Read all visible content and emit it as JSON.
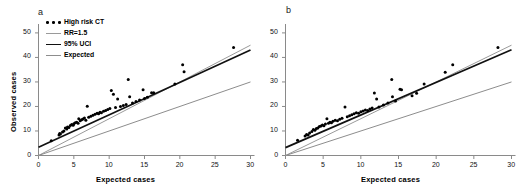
{
  "figure": {
    "panels": [
      {
        "letter": "a",
        "has_ylabel": true
      },
      {
        "letter": "b",
        "has_ylabel": false
      }
    ],
    "axis": {
      "xlabel": "Expected cases",
      "ylabel": "Observed cases",
      "xticks": [
        "0",
        "5",
        "10",
        "15",
        "20",
        "25",
        "30"
      ],
      "yticks": [
        "0",
        "10",
        "20",
        "30",
        "40",
        "50"
      ]
    },
    "legend": {
      "items": [
        {
          "label": "High risk CT",
          "key": "dots",
          "color": "#000000"
        },
        {
          "label": "RR=1.5",
          "key": "line",
          "color": "#9a9a9a"
        },
        {
          "label": "95% UCI",
          "key": "line",
          "color": "#111111"
        },
        {
          "label": "Expected",
          "key": "line",
          "color": "#8d8d8d"
        }
      ]
    }
  },
  "chart_data": {
    "type": "scatter",
    "title": "",
    "xlabel": "Expected cases",
    "ylabel": "Observed cases",
    "xlim": [
      0,
      30
    ],
    "ylim": [
      0,
      52
    ],
    "grid": false,
    "legend_position": "top-left",
    "panels": [
      {
        "id": "a",
        "letter": "a",
        "series": [
          {
            "name": "High risk CT",
            "type": "scatter",
            "color": "#000000",
            "points": [
              [
                1.8,
                6.0
              ],
              [
                2.9,
                8.4
              ],
              [
                3.0,
                9.0
              ],
              [
                3.1,
                8.8
              ],
              [
                3.4,
                9.6
              ],
              [
                3.6,
                10.0
              ],
              [
                3.8,
                11.2
              ],
              [
                4.0,
                10.8
              ],
              [
                4.1,
                11.6
              ],
              [
                4.3,
                11.4
              ],
              [
                4.5,
                12.2
              ],
              [
                4.7,
                12.6
              ],
              [
                4.9,
                12.3
              ],
              [
                5.0,
                13.0
              ],
              [
                5.2,
                13.4
              ],
              [
                5.4,
                13.6
              ],
              [
                5.6,
                13.2
              ],
              [
                5.7,
                15.0
              ],
              [
                5.9,
                14.2
              ],
              [
                6.1,
                14.6
              ],
              [
                6.3,
                14.9
              ],
              [
                6.5,
                15.3
              ],
              [
                6.7,
                14.4
              ],
              [
                6.9,
                20.1
              ],
              [
                7.1,
                15.6
              ],
              [
                7.4,
                16.0
              ],
              [
                7.7,
                16.4
              ],
              [
                8.0,
                16.8
              ],
              [
                8.3,
                17.2
              ],
              [
                8.5,
                17.0
              ],
              [
                8.7,
                17.6
              ],
              [
                8.9,
                17.4
              ],
              [
                9.2,
                18.0
              ],
              [
                9.5,
                18.4
              ],
              [
                9.8,
                18.8
              ],
              [
                10.1,
                19.2
              ],
              [
                10.3,
                26.5
              ],
              [
                10.6,
                25.0
              ],
              [
                10.9,
                19.6
              ],
              [
                11.2,
                23.0
              ],
              [
                11.6,
                20.0
              ],
              [
                12.0,
                20.4
              ],
              [
                12.4,
                20.8
              ],
              [
                12.7,
                31.0
              ],
              [
                12.9,
                24.0
              ],
              [
                13.3,
                21.4
              ],
              [
                13.8,
                22.0
              ],
              [
                14.3,
                22.6
              ],
              [
                14.8,
                26.8
              ],
              [
                15.0,
                23.2
              ],
              [
                15.4,
                23.8
              ],
              [
                16.0,
                25.6
              ],
              [
                16.3,
                25.6
              ],
              [
                19.3,
                29.2
              ],
              [
                20.4,
                37.0
              ],
              [
                20.6,
                34.2
              ],
              [
                27.6,
                44.0
              ]
            ]
          },
          {
            "name": "RR=1.5",
            "type": "line",
            "color": "#9a9a9a",
            "intercept": 0.0,
            "slope": 1.5,
            "x_range": [
              0,
              30
            ]
          },
          {
            "name": "95% UCI",
            "type": "line",
            "color": "#111111",
            "intercept": 3.4,
            "slope": 1.32,
            "x_range": [
              0,
              30
            ]
          },
          {
            "name": "Expected",
            "type": "line",
            "color": "#8d8d8d",
            "intercept": 0.0,
            "slope": 1.0,
            "x_range": [
              0,
              30
            ]
          }
        ]
      },
      {
        "id": "b",
        "letter": "b",
        "series": [
          {
            "name": "High risk CT",
            "type": "scatter",
            "color": "#000000",
            "points": [
              [
                1.6,
                6.2
              ],
              [
                2.6,
                8.0
              ],
              [
                2.8,
                8.6
              ],
              [
                3.0,
                8.4
              ],
              [
                3.2,
                9.2
              ],
              [
                3.5,
                9.8
              ],
              [
                3.7,
                10.6
              ],
              [
                3.9,
                10.3
              ],
              [
                4.1,
                11.0
              ],
              [
                4.3,
                11.2
              ],
              [
                4.5,
                11.8
              ],
              [
                4.7,
                12.0
              ],
              [
                4.9,
                12.4
              ],
              [
                5.1,
                12.1
              ],
              [
                5.3,
                12.8
              ],
              [
                5.5,
                15.0
              ],
              [
                5.7,
                13.2
              ],
              [
                5.9,
                13.6
              ],
              [
                6.1,
                13.4
              ],
              [
                6.3,
                14.0
              ],
              [
                6.6,
                14.4
              ],
              [
                6.9,
                14.2
              ],
              [
                7.2,
                14.8
              ],
              [
                7.5,
                15.2
              ],
              [
                7.9,
                19.8
              ],
              [
                8.2,
                15.8
              ],
              [
                8.5,
                16.2
              ],
              [
                8.8,
                16.6
              ],
              [
                9.1,
                17.0
              ],
              [
                9.4,
                17.4
              ],
              [
                9.7,
                17.2
              ],
              [
                10.0,
                17.8
              ],
              [
                10.3,
                18.2
              ],
              [
                10.6,
                18.6
              ],
              [
                10.9,
                18.4
              ],
              [
                11.2,
                19.0
              ],
              [
                11.5,
                19.4
              ],
              [
                11.8,
                25.5
              ],
              [
                12.1,
                23.0
              ],
              [
                12.4,
                19.8
              ],
              [
                13.0,
                20.6
              ],
              [
                13.6,
                21.4
              ],
              [
                14.1,
                31.0
              ],
              [
                14.2,
                24.0
              ],
              [
                14.6,
                22.2
              ],
              [
                15.2,
                27.0
              ],
              [
                15.4,
                26.8
              ],
              [
                16.8,
                24.4
              ],
              [
                17.4,
                25.4
              ],
              [
                18.4,
                29.2
              ],
              [
                21.2,
                34.0
              ],
              [
                22.2,
                37.0
              ],
              [
                28.2,
                44.0
              ]
            ]
          },
          {
            "name": "RR=1.5",
            "type": "line",
            "color": "#9a9a9a",
            "intercept": 0.0,
            "slope": 1.5,
            "x_range": [
              0,
              30
            ]
          },
          {
            "name": "95% UCI",
            "type": "line",
            "color": "#111111",
            "intercept": 3.2,
            "slope": 1.33,
            "x_range": [
              0,
              30
            ]
          },
          {
            "name": "Expected",
            "type": "line",
            "color": "#8d8d8d",
            "intercept": 0.0,
            "slope": 1.0,
            "x_range": [
              0,
              30
            ]
          }
        ]
      }
    ]
  }
}
